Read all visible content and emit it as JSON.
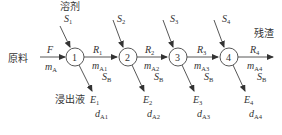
{
  "diagram": {
    "labels": {
      "feed_cn": "原料",
      "solvent_cn": "溶剂",
      "leachate_cn": "浸出液",
      "residue_cn": "残渣"
    },
    "feed": {
      "symbol": "F",
      "mass": "m",
      "mass_sub": "A"
    },
    "stages": [
      {
        "id": "1",
        "solvent": "S",
        "solvent_sub": "1",
        "raffinate": "R",
        "raffinate_sub": "1",
        "m_sub": "A1",
        "sb": "S",
        "sb_sub": "B",
        "extract": "E",
        "extract_sub": "1",
        "d_sub": "A1"
      },
      {
        "id": "2",
        "solvent": "S",
        "solvent_sub": "2",
        "raffinate": "R",
        "raffinate_sub": "2",
        "m_sub": "A2",
        "sb": "S",
        "sb_sub": "B",
        "extract": "E",
        "extract_sub": "2",
        "d_sub": "A2"
      },
      {
        "id": "3",
        "solvent": "S",
        "solvent_sub": "3",
        "raffinate": "R",
        "raffinate_sub": "3",
        "m_sub": "A3",
        "sb": "S",
        "sb_sub": "B",
        "extract": "E",
        "extract_sub": "3",
        "d_sub": "A3"
      },
      {
        "id": "4",
        "solvent": "S",
        "solvent_sub": "4",
        "raffinate": "R",
        "raffinate_sub": "4",
        "m_sub": "A4",
        "sb": "S",
        "sb_sub": "B",
        "extract": "E",
        "extract_sub": "4",
        "d_sub": "A4"
      }
    ],
    "m_symbol": "m",
    "d_symbol": "d"
  }
}
